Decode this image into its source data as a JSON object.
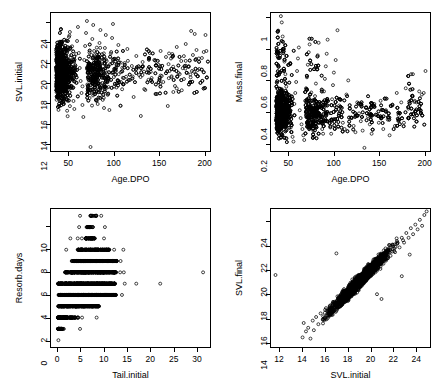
{
  "figure": {
    "layout": "2x2-scatterplot-matrix",
    "background_color": "#ffffff",
    "point_color": "#000000",
    "point_style": "open-circle"
  },
  "chart_data": [
    {
      "type": "scatter",
      "title": "",
      "xlabel": "Age.DPO",
      "ylabel": "SVL.initial",
      "xlim": [
        30,
        207
      ],
      "ylim": [
        11.2,
        25.0
      ],
      "xticks": [
        50,
        100,
        150,
        200
      ],
      "yticks": [
        12,
        14,
        16,
        18,
        20,
        22,
        24
      ],
      "grid": false,
      "legend": "none",
      "n_points_approx": 2200,
      "description": "Dense cloud at low Age.DPO (35-90) spanning SVL 14-24, fanning out and thinning toward Age.DPO 200 with SVL mostly 15-22.",
      "points": [
        [
          41,
          23.4
        ],
        [
          42,
          22.1
        ],
        [
          43,
          20.5
        ],
        [
          44,
          19.2
        ],
        [
          45,
          18.1
        ],
        [
          46,
          17.2
        ],
        [
          47,
          16.4
        ],
        [
          48,
          19.8
        ],
        [
          49,
          21.3
        ],
        [
          50,
          22.6
        ],
        [
          51,
          23.1
        ],
        [
          52,
          20.1
        ],
        [
          53,
          18.7
        ],
        [
          54,
          17.5
        ],
        [
          55,
          16.2
        ],
        [
          56,
          15.4
        ],
        [
          57,
          19.4
        ],
        [
          58,
          20.9
        ],
        [
          59,
          22.2
        ],
        [
          60,
          23.6
        ],
        [
          61,
          21.0
        ],
        [
          62,
          19.5
        ],
        [
          63,
          18.2
        ],
        [
          64,
          17.0
        ],
        [
          65,
          15.8
        ],
        [
          66,
          14.6
        ],
        [
          67,
          20.3
        ],
        [
          68,
          21.7
        ],
        [
          69,
          23.0
        ],
        [
          70,
          24.2
        ],
        [
          71,
          19.0
        ],
        [
          72,
          17.8
        ],
        [
          73,
          16.5
        ],
        [
          74,
          11.6
        ],
        [
          75,
          20.8
        ],
        [
          76,
          22.4
        ],
        [
          77,
          23.8
        ],
        [
          78,
          21.2
        ],
        [
          79,
          19.6
        ],
        [
          80,
          18.4
        ],
        [
          81,
          17.1
        ],
        [
          82,
          15.9
        ],
        [
          83,
          20.6
        ],
        [
          84,
          22.0
        ],
        [
          85,
          23.3
        ],
        [
          86,
          19.3
        ],
        [
          87,
          18.0
        ],
        [
          88,
          16.8
        ],
        [
          89,
          15.5
        ],
        [
          90,
          21.5
        ],
        [
          91,
          22.8
        ],
        [
          92,
          20.2
        ],
        [
          93,
          18.9
        ],
        [
          94,
          17.6
        ],
        [
          95,
          15.3
        ],
        [
          96,
          19.9
        ],
        [
          97,
          21.1
        ],
        [
          98,
          22.5
        ],
        [
          99,
          23.9
        ],
        [
          100,
          18.6
        ],
        [
          102,
          20.4
        ],
        [
          105,
          21.8
        ],
        [
          108,
          19.1
        ],
        [
          110,
          17.9
        ],
        [
          112,
          20.0
        ],
        [
          115,
          21.4
        ],
        [
          118,
          18.3
        ],
        [
          120,
          19.7
        ],
        [
          122,
          16.6
        ],
        [
          125,
          20.7
        ],
        [
          128,
          18.8
        ],
        [
          130,
          14.7
        ],
        [
          132,
          20.1
        ],
        [
          135,
          17.3
        ],
        [
          138,
          19.4
        ],
        [
          140,
          21.0
        ],
        [
          142,
          18.5
        ],
        [
          145,
          20.3
        ],
        [
          148,
          16.9
        ],
        [
          150,
          19.8
        ],
        [
          152,
          21.2
        ],
        [
          155,
          18.1
        ],
        [
          158,
          20.6
        ],
        [
          160,
          15.7
        ],
        [
          162,
          19.2
        ],
        [
          165,
          20.9
        ],
        [
          168,
          17.7
        ],
        [
          170,
          21.6
        ],
        [
          172,
          19.0
        ],
        [
          175,
          20.2
        ],
        [
          178,
          18.4
        ],
        [
          180,
          21.9
        ],
        [
          183,
          19.6
        ],
        [
          186,
          23.2
        ],
        [
          188,
          20.8
        ],
        [
          190,
          22.9
        ],
        [
          192,
          21.3
        ],
        [
          195,
          19.4
        ],
        [
          198,
          20.5
        ],
        [
          200,
          21.1
        ],
        [
          202,
          22.8
        ],
        [
          203,
          21.2
        ]
      ]
    },
    {
      "type": "scatter",
      "title": "",
      "xlabel": "Age.DPO",
      "ylabel": "Mass.final",
      "xlim": [
        30,
        207
      ],
      "ylim": [
        0.15,
        1.03
      ],
      "xticks": [
        50,
        100,
        150,
        200
      ],
      "yticks": [
        0.2,
        0.4,
        0.6,
        0.8,
        1.0
      ],
      "grid": false,
      "legend": "none",
      "n_points_approx": 2200,
      "description": "Very dense blob at Age.DPO 35-85 with Mass.final 0.2-0.6; scattered upper outliers to 1.0 near age 42; mass declines and tightens toward 0.2-0.5 at higher ages, with a cluster near 0.45-0.65 around age 185-202.",
      "points": [
        [
          41,
          1.01
        ],
        [
          42,
          0.97
        ],
        [
          43,
          0.88
        ],
        [
          44,
          0.8
        ],
        [
          45,
          0.72
        ],
        [
          46,
          0.64
        ],
        [
          47,
          0.56
        ],
        [
          48,
          0.48
        ],
        [
          49,
          0.42
        ],
        [
          50,
          0.38
        ],
        [
          51,
          0.34
        ],
        [
          52,
          0.3
        ],
        [
          53,
          0.27
        ],
        [
          54,
          0.24
        ],
        [
          55,
          0.21
        ],
        [
          56,
          0.45
        ],
        [
          57,
          0.52
        ],
        [
          58,
          0.59
        ],
        [
          59,
          0.66
        ],
        [
          60,
          0.74
        ],
        [
          61,
          0.81
        ],
        [
          62,
          0.41
        ],
        [
          63,
          0.36
        ],
        [
          64,
          0.32
        ],
        [
          65,
          0.29
        ],
        [
          66,
          0.25
        ],
        [
          67,
          0.22
        ],
        [
          68,
          0.47
        ],
        [
          69,
          0.55
        ],
        [
          70,
          0.62
        ],
        [
          71,
          0.7
        ],
        [
          72,
          0.78
        ],
        [
          73,
          0.83
        ],
        [
          74,
          0.4
        ],
        [
          75,
          0.35
        ],
        [
          76,
          0.31
        ],
        [
          77,
          0.28
        ],
        [
          78,
          0.24
        ],
        [
          79,
          0.5
        ],
        [
          80,
          0.58
        ],
        [
          81,
          0.67
        ],
        [
          82,
          0.76
        ],
        [
          83,
          0.84
        ],
        [
          84,
          0.43
        ],
        [
          85,
          0.37
        ],
        [
          86,
          0.33
        ],
        [
          87,
          0.29
        ],
        [
          88,
          0.26
        ],
        [
          89,
          0.53
        ],
        [
          90,
          0.61
        ],
        [
          91,
          0.69
        ],
        [
          92,
          0.77
        ],
        [
          93,
          0.86
        ],
        [
          94,
          0.39
        ],
        [
          95,
          0.34
        ],
        [
          96,
          0.3
        ],
        [
          97,
          0.26
        ],
        [
          98,
          0.48
        ],
        [
          99,
          0.57
        ],
        [
          100,
          0.65
        ],
        [
          102,
          0.73
        ],
        [
          104,
          0.92
        ],
        [
          106,
          0.44
        ],
        [
          108,
          0.38
        ],
        [
          110,
          0.33
        ],
        [
          112,
          0.29
        ],
        [
          114,
          0.51
        ],
        [
          116,
          0.6
        ],
        [
          118,
          0.42
        ],
        [
          120,
          0.36
        ],
        [
          122,
          0.31
        ],
        [
          124,
          0.27
        ],
        [
          126,
          0.46
        ],
        [
          128,
          0.39
        ],
        [
          130,
          0.34
        ],
        [
          132,
          0.28
        ],
        [
          134,
          0.17
        ],
        [
          136,
          0.43
        ],
        [
          138,
          0.37
        ],
        [
          140,
          0.32
        ],
        [
          142,
          0.26
        ],
        [
          145,
          0.45
        ],
        [
          148,
          0.38
        ],
        [
          150,
          0.33
        ],
        [
          152,
          0.47
        ],
        [
          155,
          0.29
        ],
        [
          158,
          0.41
        ],
        [
          160,
          0.35
        ],
        [
          162,
          0.25
        ],
        [
          165,
          0.44
        ],
        [
          168,
          0.31
        ],
        [
          170,
          0.52
        ],
        [
          172,
          0.38
        ],
        [
          175,
          0.46
        ],
        [
          178,
          0.33
        ],
        [
          180,
          0.55
        ],
        [
          183,
          0.42
        ],
        [
          186,
          0.64
        ],
        [
          188,
          0.64
        ],
        [
          190,
          0.47
        ],
        [
          192,
          0.46
        ],
        [
          195,
          0.53
        ],
        [
          198,
          0.51
        ],
        [
          200,
          0.52
        ],
        [
          202,
          0.66
        ]
      ]
    },
    {
      "type": "scatter",
      "title": "",
      "xlabel": "Tail.initial",
      "ylabel": "Resorb.days",
      "xlim": [
        -1.5,
        33
      ],
      "ylim": [
        -0.6,
        11.6
      ],
      "xticks": [
        0,
        5,
        10,
        15,
        20,
        25,
        30
      ],
      "yticks": [
        0,
        2,
        4,
        6,
        8,
        10
      ],
      "grid": false,
      "legend": "none",
      "n_points_approx": 2200,
      "description": "Resorb.days is integer-valued 0-11, producing horizontal bands. Band width in Tail.initial peaks at Resorb.days 4-6 (extending to ~14) with outliers at 17, 22 and 31.5; narrow bands at 0-2 and 9-11.",
      "bands": [
        {
          "resorb_days": 0,
          "tail_min": 0.0,
          "tail_max": 0.3,
          "outliers": []
        },
        {
          "resorb_days": 1,
          "tail_min": 0.0,
          "tail_max": 1.6,
          "outliers": [
            4.8
          ]
        },
        {
          "resorb_days": 2,
          "tail_min": 0.0,
          "tail_max": 5.6,
          "outliers": [
            8.4
          ]
        },
        {
          "resorb_days": 3,
          "tail_min": 0.0,
          "tail_max": 9.0,
          "outliers": []
        },
        {
          "resorb_days": 4,
          "tail_min": 0.0,
          "tail_max": 12.6,
          "outliers": [
            13.9
          ]
        },
        {
          "resorb_days": 5,
          "tail_min": 0.0,
          "tail_max": 12.4,
          "outliers": [
            14.5,
            17.0,
            22.2
          ]
        },
        {
          "resorb_days": 6,
          "tail_min": 1.5,
          "tail_max": 12.6,
          "outliers": [
            13.5,
            14.3,
            31.5
          ]
        },
        {
          "resorb_days": 7,
          "tail_min": 3.0,
          "tail_max": 12.8,
          "outliers": [
            13.6
          ]
        },
        {
          "resorb_days": 8,
          "tail_min": 4.2,
          "tail_max": 11.2,
          "outliers": [
            1.8,
            12.2,
            14.2
          ]
        },
        {
          "resorb_days": 9,
          "tail_min": 6.0,
          "tail_max": 8.0,
          "outliers": [
            2.7,
            4.3,
            5.2,
            10.0
          ]
        },
        {
          "resorb_days": 10,
          "tail_min": 6.2,
          "tail_max": 7.6,
          "outliers": [
            4.6,
            10.2
          ]
        },
        {
          "resorb_days": 11,
          "tail_min": 7.0,
          "tail_max": 8.4,
          "outliers": [
            4.8,
            9.4
          ]
        }
      ]
    },
    {
      "type": "scatter",
      "title": "",
      "xlabel": "SVL.initial",
      "ylabel": "SVL.final",
      "xlim": [
        11.2,
        25.3
      ],
      "ylim": [
        13.6,
        25.1
      ],
      "xticks": [
        12,
        14,
        16,
        18,
        20,
        22,
        24
      ],
      "yticks": [
        14,
        16,
        18,
        20,
        22,
        24
      ],
      "grid": false,
      "legend": "none",
      "n_points_approx": 2200,
      "description": "Strong positive linear relationship, slope approximately 1 with SVL.final slightly above SVL.initial; tight band from (14,14.5) to (24.5,24.8). One isolated outlier at (11.6,19.6).",
      "points": [
        [
          11.6,
          19.6
        ],
        [
          14.0,
          14.4
        ],
        [
          14.1,
          15.6
        ],
        [
          14.3,
          14.9
        ],
        [
          14.5,
          15.2
        ],
        [
          14.7,
          14.3
        ],
        [
          14.9,
          15.8
        ],
        [
          15.0,
          15.0
        ],
        [
          15.2,
          16.1
        ],
        [
          15.4,
          15.5
        ],
        [
          15.6,
          16.4
        ],
        [
          15.8,
          15.9
        ],
        [
          16.0,
          16.7
        ],
        [
          16.2,
          16.2
        ],
        [
          16.4,
          17.0
        ],
        [
          16.6,
          16.6
        ],
        [
          16.8,
          17.3
        ],
        [
          17.0,
          21.4
        ],
        [
          17.0,
          17.1
        ],
        [
          17.2,
          17.6
        ],
        [
          17.4,
          17.2
        ],
        [
          17.6,
          18.0
        ],
        [
          17.8,
          17.7
        ],
        [
          18.0,
          18.4
        ],
        [
          18.2,
          18.0
        ],
        [
          18.4,
          18.7
        ],
        [
          18.6,
          18.3
        ],
        [
          18.8,
          19.1
        ],
        [
          19.0,
          18.7
        ],
        [
          19.2,
          19.4
        ],
        [
          19.4,
          19.0
        ],
        [
          19.6,
          19.8
        ],
        [
          19.8,
          19.4
        ],
        [
          20.0,
          20.2
        ],
        [
          20.2,
          19.8
        ],
        [
          20.4,
          20.5
        ],
        [
          20.6,
          20.1
        ],
        [
          20.8,
          20.9
        ],
        [
          21.0,
          20.5
        ],
        [
          21.2,
          21.2
        ],
        [
          21.4,
          20.8
        ],
        [
          21.6,
          21.6
        ],
        [
          21.8,
          21.2
        ],
        [
          22.0,
          22.0
        ],
        [
          22.2,
          21.5
        ],
        [
          22.4,
          22.3
        ],
        [
          22.6,
          21.9
        ],
        [
          22.8,
          22.7
        ],
        [
          23.0,
          22.3
        ],
        [
          23.2,
          23.1
        ],
        [
          23.4,
          22.7
        ],
        [
          23.6,
          23.5
        ],
        [
          23.8,
          23.0
        ],
        [
          24.0,
          23.8
        ],
        [
          24.2,
          23.4
        ],
        [
          24.4,
          24.2
        ],
        [
          24.6,
          23.7
        ],
        [
          24.8,
          24.6
        ],
        [
          25.0,
          24.9
        ],
        [
          22.8,
          19.5
        ],
        [
          23.5,
          21.3
        ],
        [
          21.0,
          17.6
        ],
        [
          20.6,
          18.0
        ]
      ]
    }
  ]
}
